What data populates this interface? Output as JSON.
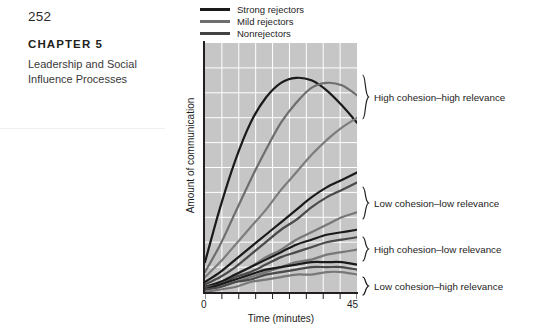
{
  "page": {
    "folio": "252",
    "chapter_label": "CHAPTER 5",
    "chapter_title": "Leadership and Social Influence Processes"
  },
  "figure": {
    "legend": {
      "items": [
        {
          "label": "Strong rejectors",
          "color": "#1a1a1a"
        },
        {
          "label": "Mild rejectors",
          "color": "#6e6e6e"
        },
        {
          "label": "Nonrejectors",
          "color": "#434343"
        }
      ]
    },
    "annotations": [
      {
        "label": "High cohesion–high relevance"
      },
      {
        "label": "Low cohesion–low relevance"
      },
      {
        "label": "High cohesion–low relevance"
      },
      {
        "label": "Low cohesion–high relevance"
      }
    ]
  },
  "chart_data": {
    "type": "line",
    "title": "",
    "xlabel": "Time (minutes)",
    "ylabel": "Amount of communication",
    "xlim": [
      0,
      45
    ],
    "ylim": [
      0,
      100
    ],
    "xticks": [
      0,
      45
    ],
    "xtick_labels": [
      "0",
      "45"
    ],
    "yticks": [],
    "ytick_labels": [],
    "grid": true,
    "grid_color": "#ffffff",
    "plot_background": "#c6c6c6",
    "legend_position": "above-plot-left",
    "x": [
      0,
      4.5,
      9,
      13.5,
      18,
      22.5,
      27,
      31.5,
      36,
      40.5,
      45
    ],
    "groups": [
      {
        "name": "High cohesion–high relevance",
        "series": [
          {
            "name": "Strong rejectors",
            "color": "#1a1a1a",
            "values": [
              12,
              34,
              53,
              68,
              78,
              84,
              86,
              85,
              81,
              75,
              68
            ]
          },
          {
            "name": "Mild rejectors",
            "color": "#6e6e6e",
            "values": [
              8,
              19,
              32,
              45,
              57,
              68,
              76,
              82,
              84,
              83,
              79
            ]
          },
          {
            "name": "Nonrejectors",
            "color": "#7d7d7d",
            "values": [
              6,
              12,
              19,
              26,
              33,
              41,
              48,
              55,
              61,
              66,
              70
            ]
          }
        ]
      },
      {
        "name": "Low cohesion–low relevance",
        "series": [
          {
            "name": "Strong rejectors",
            "color": "#1a1a1a",
            "values": [
              4,
              8,
              13,
              18,
              23,
              28,
              33,
              38,
              42,
              45,
              48
            ]
          },
          {
            "name": "Mild rejectors",
            "color": "#4a4a4a",
            "values": [
              3,
              6,
              10,
              15,
              20,
              25,
              29,
              34,
              38,
              41,
              44
            ]
          },
          {
            "name": "Nonrejectors",
            "color": "#787878",
            "values": [
              2,
              4,
              7,
              10,
              14,
              17,
              21,
              24,
              27,
              30,
              32
            ]
          }
        ]
      },
      {
        "name": "High cohesion–low relevance",
        "series": [
          {
            "name": "Strong rejectors",
            "color": "#1a1a1a",
            "values": [
              2,
              4,
              7,
              10,
              13,
              16,
              19,
              21,
              23,
              24,
              25
            ]
          },
          {
            "name": "Mild rejectors",
            "color": "#4a4a4a",
            "values": [
              2,
              3,
              6,
              8,
              11,
              14,
              16,
              18,
              20,
              21,
              22
            ]
          },
          {
            "name": "Nonrejectors",
            "color": "#787878",
            "values": [
              1,
              2,
              4,
              6,
              8,
              10,
              12,
              13,
              15,
              16,
              17
            ]
          }
        ]
      },
      {
        "name": "Low cohesion–high relevance",
        "series": [
          {
            "name": "Strong rejectors",
            "color": "#1a1a1a",
            "values": [
              1,
              3,
              5,
              7,
              9,
              10,
              11,
              12,
              12,
              12,
              11
            ]
          },
          {
            "name": "Mild rejectors",
            "color": "#4a4a4a",
            "values": [
              1,
              2,
              4,
              5,
              7,
              8,
              9,
              10,
              10,
              10,
              9
            ]
          },
          {
            "name": "Nonrejectors",
            "color": "#787878",
            "values": [
              0,
              1,
              2,
              4,
              5,
              6,
              7,
              7,
              8,
              8,
              7
            ]
          }
        ]
      }
    ]
  }
}
